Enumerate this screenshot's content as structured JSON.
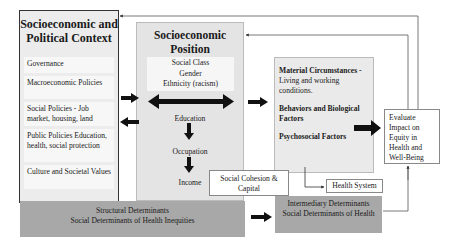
{
  "diagram": {
    "context": {
      "title_line1": "Socioeconomic and",
      "title_line2": "Political Context",
      "items": [
        {
          "label": "Governance"
        },
        {
          "label": "Macroeconomic Policies"
        },
        {
          "label": "Social Policies - Job market, housing, land"
        },
        {
          "label": "Public Policies Education, health, social protection"
        },
        {
          "label": "Culture and Societal Values"
        }
      ]
    },
    "position": {
      "title_line1": "Socioeconomic",
      "title_line2": "Position",
      "stratifiers": [
        "Social Class",
        "Gender",
        "Ethnicity (racism)"
      ],
      "chain": [
        "Education",
        "Occupation",
        "Income"
      ]
    },
    "intermediary": {
      "material_bold": "Material Circumstances -",
      "material_text": "Living and working conditions.",
      "behaviors": "Behaviors and Biological Factors",
      "psychosocial": "Psychosocial Factors"
    },
    "evaluate": {
      "label": "Evaluate Impact on Equity in Health and Well-Being"
    },
    "cohesion": {
      "label": "Social Cohesion & Capital"
    },
    "health_system": {
      "label": "Health System"
    },
    "bands": {
      "structural_line1": "Structural Determinants",
      "structural_line2": "Social Determinants of Health Inequities",
      "intermediary_line1": "Intermediary Determinants",
      "intermediary_line2": "Social Determinants of Health"
    },
    "colors": {
      "band_gray": "#a8a8a8",
      "box_gray": "#e6e6e6",
      "arrow": "#111111"
    }
  }
}
